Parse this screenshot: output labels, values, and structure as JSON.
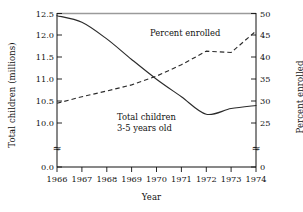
{
  "chart_data": {
    "type": "line",
    "title": "",
    "xlabel": "Year",
    "ylabel": "Total children (millions)",
    "ylabel_right": "Percent enrolled",
    "grid": false,
    "legend_position": "inline-annotations",
    "x": [
      1966,
      1967,
      1968,
      1969,
      1970,
      1971,
      1972,
      1973,
      1974
    ],
    "xticklabels": [
      "1966",
      "1967",
      "1968",
      "1969",
      "1970",
      "1971",
      "1972",
      "1973",
      "1974"
    ],
    "xlim": [
      1966,
      1974
    ],
    "ylim_left": [
      0.0,
      12.5
    ],
    "yticks_left": [
      0.0,
      10.0,
      10.5,
      11.0,
      11.5,
      12.0,
      12.5
    ],
    "yticklabels_left": [
      "0.0",
      "10.0",
      "10.5",
      "11.0",
      "11.5",
      "12.0",
      "12.5"
    ],
    "y_axis_break_left": true,
    "ylim_right": [
      0,
      50
    ],
    "yticks_right": [
      0,
      25,
      30,
      35,
      40,
      45,
      50
    ],
    "yticklabels_right": [
      "0",
      "25",
      "30",
      "35",
      "40",
      "45",
      "50"
    ],
    "y_axis_break_right": true,
    "axis_break_symbol": "≈",
    "series": [
      {
        "name": "Total children 3-5 years old",
        "axis": "left",
        "style": "solid",
        "units": "millions",
        "values": [
          12.45,
          12.3,
          11.92,
          11.45,
          11.0,
          10.6,
          10.2,
          10.33,
          10.4
        ]
      },
      {
        "name": "Percent enrolled",
        "axis": "right",
        "style": "dashed",
        "units": "percent",
        "values": [
          29.5,
          31.0,
          32.3,
          33.7,
          35.7,
          38.3,
          41.4,
          41.1,
          46.0
        ]
      }
    ],
    "annotations": [
      {
        "name": "percent-enrolled-label",
        "text": "Percent enrolled",
        "x": 1970.6,
        "y_right": 46.5
      },
      {
        "name": "total-children-label-line1",
        "text": "Total children",
        "x": 1969.4,
        "y_left": 10.62
      },
      {
        "name": "total-children-label-line2",
        "text": "3-5 years old",
        "x": 1969.4,
        "y_left": 10.4
      }
    ]
  },
  "axes": {
    "left_title": "Total children (millions)",
    "right_title": "Percent enrolled",
    "x_title": "Year"
  },
  "labels": {
    "percent_enrolled": "Percent enrolled",
    "total_children_line1": "Total children",
    "total_children_line2": "3-5 years old"
  },
  "colors": {
    "line": "#2b2b2b",
    "axis": "#111111",
    "top_rule": "#9a9a9a",
    "background": "#ffffff"
  }
}
